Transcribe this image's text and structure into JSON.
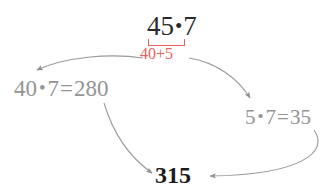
{
  "diagram": {
    "background_color": "#ffffff",
    "colors": {
      "primary_text": "#2b2b2b",
      "branch_text": "#949494",
      "accent_red": "#e8615b",
      "result_text": "#1c1c1c",
      "arrow": "#9a9a9a"
    },
    "top_expression": {
      "left_factor": "45",
      "operator": "•",
      "right_factor": "7"
    },
    "decomposition": {
      "first_part": "40",
      "operator": "+",
      "second_part": "5",
      "bracket": "under-bracket"
    },
    "branches": [
      {
        "name": "left-branch",
        "left_factor": "40",
        "operator": "•",
        "right_factor": "7",
        "equals": "=",
        "product": "280"
      },
      {
        "name": "right-branch",
        "left_factor": "5",
        "operator": "•",
        "right_factor": "7",
        "equals": "=",
        "product": "35"
      }
    ],
    "result": {
      "value": "315"
    },
    "arrows": [
      {
        "name": "arrow-to-left-branch",
        "from": "decomposition",
        "to": "left-branch"
      },
      {
        "name": "arrow-to-right-branch",
        "from": "decomposition",
        "to": "right-branch"
      },
      {
        "name": "arrow-left-branch-to-result",
        "from": "left-branch",
        "to": "result"
      },
      {
        "name": "arrow-right-branch-to-result",
        "from": "right-branch",
        "to": "result"
      }
    ]
  }
}
